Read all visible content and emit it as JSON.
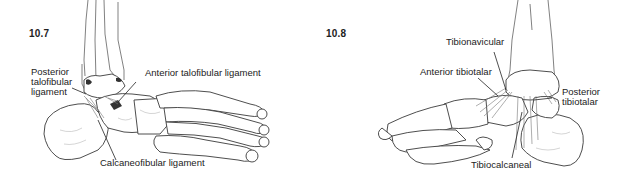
{
  "figures": [
    {
      "number": "10.7",
      "view": "lateral",
      "labels": {
        "posterior_talofibular": [
          "Posterior",
          "talofibular",
          "ligament"
        ],
        "anterior_talofibular": "Anterior talofibular ligament",
        "calcaneofibular": "Calcaneofibular ligament"
      }
    },
    {
      "number": "10.8",
      "view": "medial",
      "labels": {
        "tibionavicular": "Tibionavicular",
        "anterior_tibiotalar": "Anterior tibiotalar",
        "posterior_tibiotalar": [
          "Posterior",
          "tibiotalar"
        ],
        "tibiocalcaneal": "Tibiocalcaneal"
      }
    }
  ]
}
